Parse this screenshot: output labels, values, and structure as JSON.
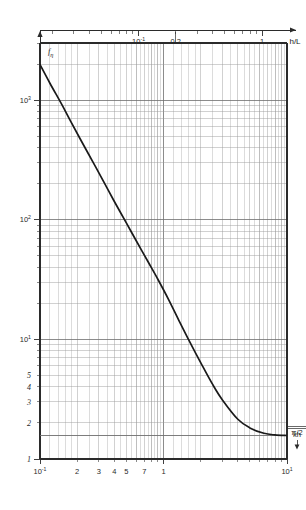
{
  "chart_data": {
    "type": "line",
    "title": "",
    "xlabel": "kh",
    "ylabel": "f_eta",
    "top_axis_label": "h/L",
    "xscale": "log",
    "yscale": "log",
    "xlim": [
      0.1,
      10
    ],
    "ylim": [
      1,
      3000
    ],
    "grid": true,
    "legend": false,
    "x_tick_labels": [
      "10",
      "2",
      "3",
      "4",
      "5",
      "7",
      "1",
      "10"
    ],
    "x_tick_exponents": [
      "-1",
      "",
      "",
      "",
      "",
      "",
      "",
      "1"
    ],
    "x_tick_values": [
      0.1,
      0.2,
      0.3,
      0.4,
      0.5,
      0.7,
      1.0,
      10.0
    ],
    "y_tick_labels": [
      "10",
      "10",
      "10",
      "5",
      "4",
      "3",
      "2",
      "1"
    ],
    "y_tick_exponents": [
      "3",
      "2",
      "1",
      "",
      "",
      "",
      "",
      ""
    ],
    "y_tick_values": [
      1000,
      100,
      10,
      5,
      4,
      3,
      2,
      1
    ],
    "top_tick_labels": [
      "10",
      "0.2",
      "1"
    ],
    "top_tick_exponents": [
      "-1",
      "",
      ""
    ],
    "top_tick_values": [
      0.1,
      0.2,
      1.0
    ],
    "asymptote_label": "π/2",
    "asymptote_value": 1.5708,
    "series": [
      {
        "name": "f_eta",
        "x": [
          0.1,
          0.12,
          0.15,
          0.18,
          0.22,
          0.27,
          0.33,
          0.4,
          0.5,
          0.6,
          0.75,
          0.9,
          1.1,
          1.35,
          1.6,
          2.0,
          2.5,
          3.0,
          4.0,
          5.0,
          6.5,
          8.0,
          10.0
        ],
        "y": [
          1980,
          1390,
          920,
          645,
          440,
          300,
          205,
          142,
          94,
          67,
          44.5,
          31.8,
          21.5,
          14.0,
          9.9,
          6.4,
          4.2,
          3.12,
          2.15,
          1.82,
          1.64,
          1.59,
          1.572
        ]
      }
    ],
    "curve_note": "monotonic decreasing, flattens to pi/2 asymptote"
  },
  "axes": {
    "y_axis_title": "f",
    "y_axis_subscript": "η",
    "bottom_axis_title": "kh",
    "top_axis_title": "h/L"
  },
  "colors": {
    "curve": "#1a1a1a",
    "grid_major": "#6f6f6f",
    "grid_minor": "#9a9a9a",
    "frame": "#2b2b2b",
    "background": "#ffffff"
  }
}
